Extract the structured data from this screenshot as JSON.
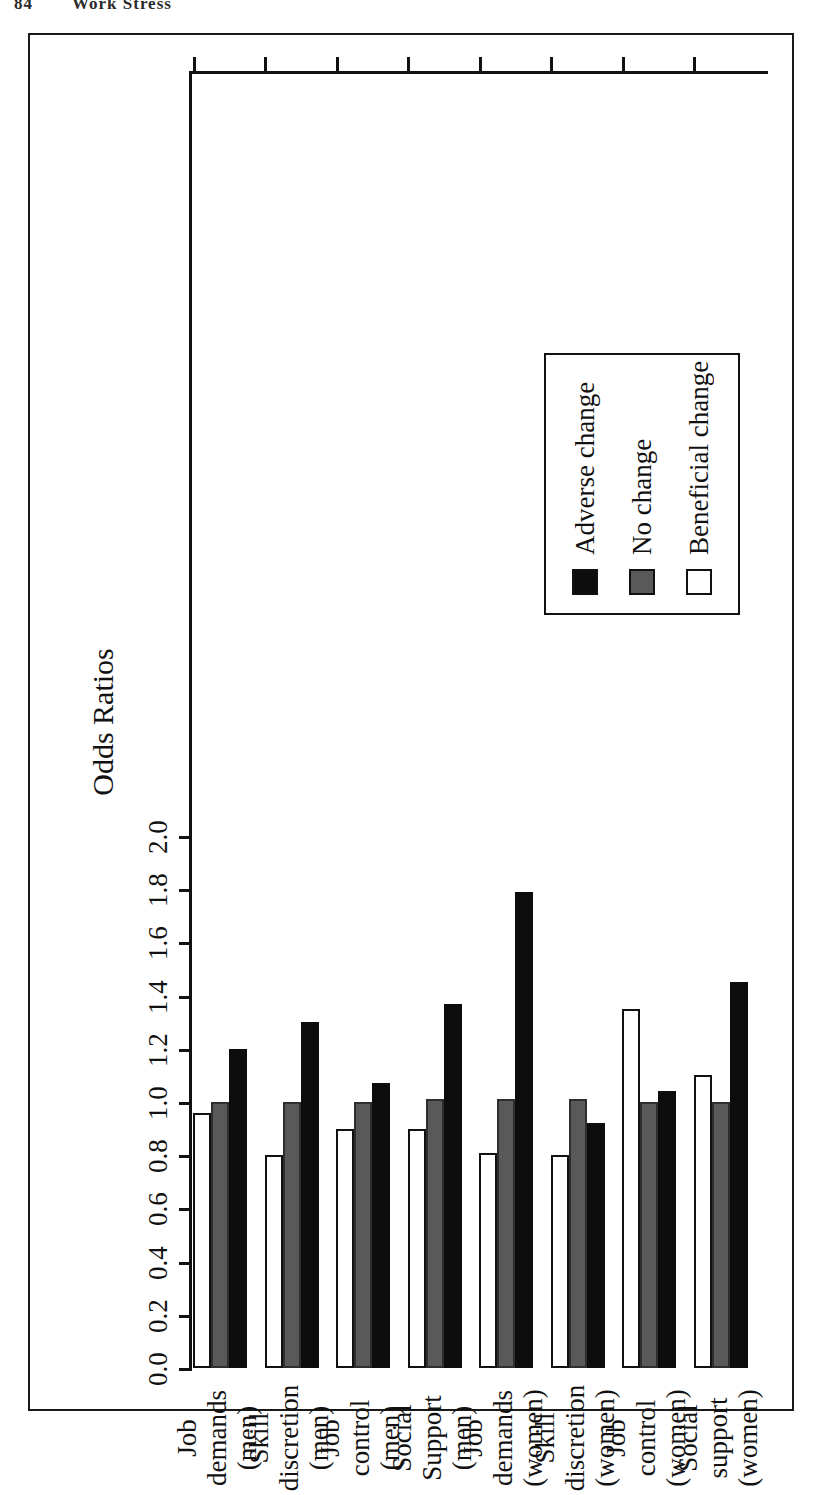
{
  "running_head": {
    "page_number": "84",
    "title": "Work Stress"
  },
  "chart_data": {
    "type": "bar",
    "orientation": "horizontal",
    "title": "",
    "xlabel": "",
    "ylabel": "Odds Ratios",
    "value_axis_title": "Odds Ratios",
    "ylim": [
      0.0,
      2.0
    ],
    "grid": false,
    "legend_position": "upper-left",
    "tick_labels": [
      "2.0",
      "1.8",
      "1.6",
      "1.4",
      "1.2",
      "1.0",
      "0.8",
      "0.6",
      "0.4",
      "0.2",
      "0.0"
    ],
    "tick_values": [
      2.0,
      1.8,
      1.6,
      1.4,
      1.2,
      1.0,
      0.8,
      0.6,
      0.4,
      0.2,
      0.0
    ],
    "categories": [
      "Social support\n(women)",
      "Job control\n(women)",
      "Skill\ndiscretion\n(women)",
      "Job demands\n(women)",
      "Social\nSupport\n(men)",
      "Job control\n(men)",
      "Skill\ndiscretion\n(men)",
      "Job demands\n(men)"
    ],
    "series": [
      {
        "name": "Adverse change",
        "color": "#0d0d0d",
        "values": [
          1.45,
          1.04,
          0.92,
          1.79,
          1.37,
          1.07,
          1.3,
          1.2
        ]
      },
      {
        "name": "No change",
        "color": "#595959",
        "values": [
          1.0,
          1.0,
          1.01,
          1.01,
          1.01,
          1.0,
          1.0,
          1.0
        ]
      },
      {
        "name": "Beneficial change",
        "color": "#ffffff",
        "values": [
          1.1,
          1.35,
          0.8,
          0.81,
          0.9,
          0.9,
          0.8,
          0.96
        ]
      }
    ]
  },
  "legend": {
    "items": [
      {
        "label": "Adverse change",
        "swatch": "adverse"
      },
      {
        "label": "No change",
        "swatch": "nochange"
      },
      {
        "label": "Beneficial change",
        "swatch": "beneficial"
      }
    ]
  }
}
